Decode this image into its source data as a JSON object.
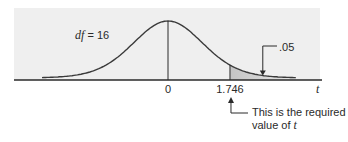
{
  "chart_data": {
    "type": "area",
    "title": "",
    "distribution": "Student t",
    "df": 16,
    "df_label": "df = 16",
    "df_label_parts": {
      "symbol": "df",
      "equals": " = 16"
    },
    "xlabel": "t",
    "x_ticks": [
      {
        "value": 0,
        "label": "0"
      },
      {
        "value": 1.746,
        "label": "1.746"
      }
    ],
    "shaded_region": {
      "from": 1.746,
      "to": "inf",
      "tail": "right",
      "area": 0.05,
      "label": ".05"
    },
    "annotations": [
      {
        "target": "critical_value",
        "value": 1.746,
        "text_line1": "This is the required",
        "text_line2_prefix": "value of ",
        "text_line2_symbol": "t"
      }
    ],
    "grid": false,
    "legend": "none"
  },
  "colors": {
    "panel": "#efefef",
    "curve": "#3a3a3a",
    "axis": "#2a2a2a",
    "shade": "#c8c8c8"
  }
}
